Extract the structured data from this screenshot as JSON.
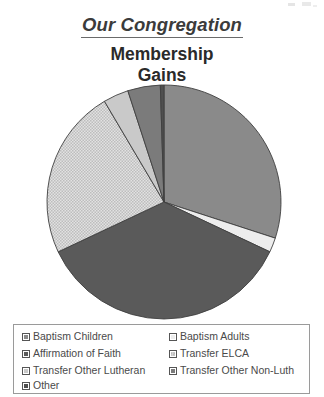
{
  "header": {
    "main_title": "Our Congregation",
    "chart_title_line1": "Membership",
    "chart_title_line2": "Gains"
  },
  "colors": {
    "baptism_children": "#8a8a8a",
    "baptism_adults": "#ededed",
    "affirmation_of_faith": "#5a5a5a",
    "transfer_elca": "#d4d4d4",
    "transfer_other_lutheran": "#c9c9c9",
    "transfer_other_non_luth": "#7b7b7b",
    "other": "#4f4f4f",
    "outline": "#404040",
    "title_text": "#3b3b3b",
    "legend_border": "#9a9a9a"
  },
  "legend": {
    "items": [
      {
        "label": "Baptism Children",
        "swatch": "swatch-baptism-children",
        "color": "#8a8a8a",
        "pattern": "solid"
      },
      {
        "label": "Baptism Adults",
        "swatch": "swatch-baptism-adults",
        "color": "#ededed",
        "pattern": "solid"
      },
      {
        "label": "Affirmation of Faith",
        "swatch": "swatch-affirmation-of-faith",
        "color": "#5a5a5a",
        "pattern": "solid"
      },
      {
        "label": "Transfer ELCA",
        "swatch": "swatch-transfer-elca",
        "color": "#d4d4d4",
        "pattern": "checker"
      },
      {
        "label": "Transfer Other Lutheran",
        "swatch": "swatch-transfer-other-lutheran",
        "color": "#c9c9c9",
        "pattern": "solid"
      },
      {
        "label": "Transfer Other Non-Luth",
        "swatch": "swatch-transfer-other-non-luth",
        "color": "#7b7b7b",
        "pattern": "solid"
      },
      {
        "label": "Other",
        "swatch": "swatch-other",
        "color": "#4f4f4f",
        "pattern": "solid"
      }
    ]
  },
  "chart_data": {
    "type": "pie",
    "title": "Membership Gains",
    "supertitle": "Our Congregation",
    "xlabel": "",
    "ylabel": "",
    "grid": false,
    "legend_position": "bottom",
    "start_angle_deg": 0,
    "direction": "clockwise",
    "categories": [
      "Baptism Children",
      "Baptism Adults",
      "Affirmation of Faith",
      "Transfer ELCA",
      "Transfer Other Lutheran",
      "Transfer Other Non-Luth",
      "Other"
    ],
    "values": [
      30,
      2,
      36,
      23.5,
      3.5,
      4.5,
      0.5
    ],
    "units": "percent",
    "slice_angles_deg": [
      108,
      7.2,
      129.6,
      84.6,
      12.6,
      16.2,
      1.8
    ],
    "colors": [
      "#8a8a8a",
      "#ededed",
      "#5a5a5a",
      "#d4d4d4",
      "#c9c9c9",
      "#7b7b7b",
      "#4f4f4f"
    ],
    "patterns": [
      "solid",
      "solid",
      "solid",
      "checker",
      "solid",
      "solid",
      "solid"
    ],
    "center": {
      "x": 119,
      "y": 118
    },
    "radius": 117
  }
}
